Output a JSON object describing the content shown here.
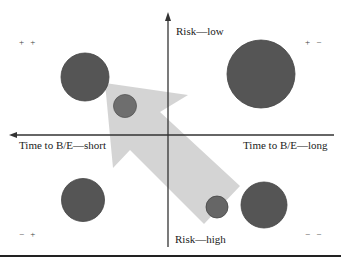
{
  "diagram": {
    "type": "quadrant-bubble",
    "axes": {
      "x_left_label": "Time to B/E—short",
      "x_right_label": "Time to B/E—long",
      "y_top_label": "Risk—low",
      "y_bottom_label": "Risk—high"
    },
    "quadrants": {
      "top_left": "+ +",
      "top_right": "+ −",
      "bottom_left": "− +",
      "bottom_right": "− −"
    },
    "bubbles": [
      {
        "id": "tl-large",
        "cx": 85,
        "cy": 77,
        "r": 24
      },
      {
        "id": "tl-small",
        "cx": 125,
        "cy": 106,
        "r": 11
      },
      {
        "id": "tr-large",
        "cx": 261,
        "cy": 74,
        "r": 34
      },
      {
        "id": "bl-medium",
        "cx": 83,
        "cy": 200,
        "r": 21
      },
      {
        "id": "br-small",
        "cx": 217,
        "cy": 207,
        "r": 11
      },
      {
        "id": "br-medium",
        "cx": 264,
        "cy": 205,
        "r": 23
      }
    ],
    "arrow": {
      "direction": "toward top-left",
      "meaning": "from high risk / long B/E toward low risk / short B/E"
    },
    "colors": {
      "bubble": "#555555",
      "bubble_small": "#6e6e6e",
      "arrow": "#cfcfcf",
      "axis": "#333333"
    }
  }
}
